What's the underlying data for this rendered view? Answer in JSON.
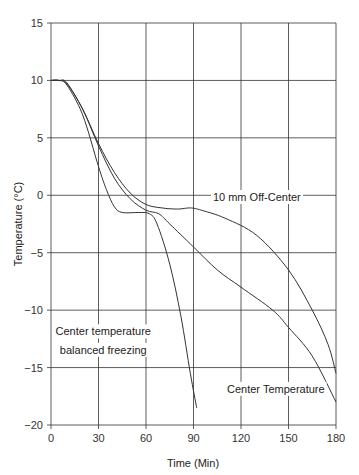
{
  "chart_data": {
    "type": "line",
    "title": "",
    "xlabel": "Time (Min)",
    "ylabel": "Temperature (°C)",
    "xlim": [
      0,
      180
    ],
    "ylim": [
      -20,
      15
    ],
    "xticks": [
      0,
      30,
      60,
      90,
      120,
      150,
      180
    ],
    "yticks": [
      15,
      10,
      5,
      0,
      -5,
      -10,
      -15,
      -20
    ],
    "xtick_labels": [
      "0",
      "30",
      "60",
      "90",
      "120",
      "150",
      "180"
    ],
    "ytick_labels": [
      "15",
      "10",
      "5",
      "0",
      "−5",
      "−10",
      "−15",
      "−20"
    ],
    "grid": true,
    "legend": "none (inline annotations)",
    "series": [
      {
        "name": "Center temperature balanced freezing",
        "x": [
          0,
          5,
          10,
          20,
          30,
          35,
          40,
          45,
          55,
          62,
          67,
          75,
          82,
          88,
          92
        ],
        "y": [
          10,
          10,
          9.6,
          7,
          2.5,
          0.5,
          -1,
          -1.5,
          -1.5,
          -1.6,
          -2.5,
          -6,
          -10.5,
          -15.5,
          -18.5
        ]
      },
      {
        "name": "10 mm Off-Center",
        "x": [
          0,
          5,
          10,
          20,
          30,
          40,
          50,
          60,
          70,
          80,
          88,
          95,
          110,
          130,
          150,
          165,
          175,
          180
        ],
        "y": [
          10,
          10,
          9.8,
          7.5,
          4.5,
          2,
          0.2,
          -0.8,
          -1.1,
          -1.2,
          -1.1,
          -1.3,
          -2,
          -3.5,
          -6.5,
          -10,
          -13,
          -15.5
        ]
      },
      {
        "name": "Center Temperature",
        "x": [
          0,
          5,
          10,
          20,
          30,
          40,
          50,
          60,
          68,
          75,
          90,
          105,
          120,
          140,
          150,
          165,
          180
        ],
        "y": [
          10,
          10,
          9.7,
          7.5,
          4.3,
          1.5,
          -0.3,
          -1.3,
          -1.6,
          -2.5,
          -4.5,
          -6.5,
          -8,
          -10,
          -11.5,
          -14,
          -18
        ]
      }
    ],
    "annotations": [
      {
        "text": "10 mm Off-Center",
        "x": 130,
        "y": -0.5
      },
      {
        "text": "Center temperature",
        "x": 33,
        "y": -12.2
      },
      {
        "text": "balanced freezing",
        "x": 33,
        "y": -13.8
      },
      {
        "text": "Center Temperature",
        "x": 142,
        "y": -17.2
      }
    ]
  }
}
